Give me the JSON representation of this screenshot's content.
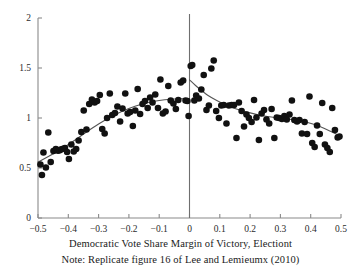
{
  "figure": {
    "xaxis_title": "Democratic Vote Share Margin of Victory, Electiont",
    "note": "Note: Replicate figure 16 of Lee and Lemieumx (2010)"
  },
  "chart_data": {
    "type": "scatter",
    "title": "",
    "subtitle": "",
    "xlabel": "Democratic Vote Share Margin of Victory, Electiont",
    "ylabel": "",
    "note": "Note: Replicate figure 16 of Lee and Lemieumx (2010)",
    "xlim": [
      -0.5,
      0.5
    ],
    "ylim": [
      0,
      2
    ],
    "xticks": [
      -0.5,
      -0.4,
      -0.3,
      -0.2,
      -0.1,
      0,
      0.1,
      0.2,
      0.3,
      0.4,
      0.5
    ],
    "xtick_labels": [
      "-0.5",
      "-0.4",
      "-0.3",
      "-0.2",
      "-0.1",
      "0",
      "0.1",
      "0.2",
      "0.3",
      "0.4",
      "0.5"
    ],
    "yticks": [
      0,
      0.5,
      1,
      1.5,
      2
    ],
    "ytick_labels": [
      "0",
      "0.5",
      "1",
      "1.5",
      "2"
    ],
    "grid": false,
    "legend": "none",
    "cutoff": 0,
    "cutoff_line": true,
    "marker_color": "#111111",
    "marker_size": 3.3,
    "fit_color": "#555555",
    "axis_color": "#8a8a8a",
    "series": [
      {
        "name": "binned means",
        "type": "scatter",
        "points": [
          [
            -0.492,
            0.535
          ],
          [
            -0.487,
            0.43
          ],
          [
            -0.482,
            0.655
          ],
          [
            -0.474,
            0.505
          ],
          [
            -0.466,
            0.855
          ],
          [
            -0.458,
            0.56
          ],
          [
            -0.449,
            0.67
          ],
          [
            -0.441,
            0.69
          ],
          [
            -0.434,
            0.672
          ],
          [
            -0.428,
            0.678
          ],
          [
            -0.423,
            0.688
          ],
          [
            -0.417,
            0.693
          ],
          [
            -0.411,
            0.7
          ],
          [
            -0.404,
            0.66
          ],
          [
            -0.398,
            0.59
          ],
          [
            -0.39,
            0.735
          ],
          [
            -0.382,
            0.665
          ],
          [
            -0.374,
            0.69
          ],
          [
            -0.366,
            0.775
          ],
          [
            -0.357,
            0.86
          ],
          [
            -0.349,
            1.075
          ],
          [
            -0.34,
            0.885
          ],
          [
            -0.331,
            1.14
          ],
          [
            -0.322,
            1.185
          ],
          [
            -0.313,
            1.155
          ],
          [
            -0.305,
            1.17
          ],
          [
            -0.296,
            1.23
          ],
          [
            -0.288,
            0.89
          ],
          [
            -0.28,
            0.845
          ],
          [
            -0.272,
            1.0
          ],
          [
            -0.263,
            1.245
          ],
          [
            -0.255,
            1.03
          ],
          [
            -0.246,
            1.05
          ],
          [
            -0.238,
            1.115
          ],
          [
            -0.229,
            0.965
          ],
          [
            -0.221,
            1.095
          ],
          [
            -0.212,
            1.245
          ],
          [
            -0.204,
            1.045
          ],
          [
            -0.196,
            1.06
          ],
          [
            -0.187,
            0.92
          ],
          [
            -0.179,
            1.075
          ],
          [
            -0.171,
            1.29
          ],
          [
            -0.163,
            1.04
          ],
          [
            -0.155,
            1.14
          ],
          [
            -0.147,
            1.17
          ],
          [
            -0.138,
            1.1
          ],
          [
            -0.13,
            1.205
          ],
          [
            -0.122,
            1.155
          ],
          [
            -0.113,
            1.235
          ],
          [
            -0.104,
            1.1
          ],
          [
            -0.096,
            1.385
          ],
          [
            -0.088,
            1.045
          ],
          [
            -0.079,
            1.065
          ],
          [
            -0.07,
            1.32
          ],
          [
            -0.062,
            1.175
          ],
          [
            -0.053,
            1.145
          ],
          [
            -0.045,
            1.09
          ],
          [
            -0.037,
            1.18
          ],
          [
            -0.029,
            1.355
          ],
          [
            -0.021,
            1.375
          ],
          [
            -0.013,
            1.175
          ],
          [
            -0.007,
            1.17
          ],
          [
            -0.003,
            1.02
          ],
          [
            0.004,
            1.52
          ],
          [
            0.009,
            1.53
          ],
          [
            0.016,
            1.175
          ],
          [
            0.022,
            1.225
          ],
          [
            0.031,
            1.195
          ],
          [
            0.039,
            1.285
          ],
          [
            0.047,
            1.43
          ],
          [
            0.056,
            1.08
          ],
          [
            0.064,
            1.125
          ],
          [
            0.072,
            1.495
          ],
          [
            0.08,
            1.575
          ],
          [
            0.088,
            1.07
          ],
          [
            0.097,
            1.0
          ],
          [
            0.105,
            1.125
          ],
          [
            0.113,
            1.13
          ],
          [
            0.122,
            0.945
          ],
          [
            0.13,
            1.125
          ],
          [
            0.139,
            1.13
          ],
          [
            0.147,
            1.13
          ],
          [
            0.155,
            0.8
          ],
          [
            0.163,
            1.155
          ],
          [
            0.172,
            1.07
          ],
          [
            0.18,
            0.915
          ],
          [
            0.188,
            1.035
          ],
          [
            0.196,
            1.0
          ],
          [
            0.205,
            0.96
          ],
          [
            0.213,
            1.18
          ],
          [
            0.221,
            1.005
          ],
          [
            0.229,
            0.78
          ],
          [
            0.238,
            1.045
          ],
          [
            0.246,
            1.08
          ],
          [
            0.254,
            0.985
          ],
          [
            0.263,
            0.945
          ],
          [
            0.271,
            1.09
          ],
          [
            0.28,
            0.8
          ],
          [
            0.288,
            1.005
          ],
          [
            0.296,
            1.0
          ],
          [
            0.305,
            0.99
          ],
          [
            0.313,
            1.02
          ],
          [
            0.321,
            0.985
          ],
          [
            0.33,
            1.035
          ],
          [
            0.338,
            1.175
          ],
          [
            0.346,
            0.98
          ],
          [
            0.355,
            0.965
          ],
          [
            0.363,
            0.98
          ],
          [
            0.371,
            0.845
          ],
          [
            0.38,
            0.96
          ],
          [
            0.388,
            0.84
          ],
          [
            0.396,
            1.215
          ],
          [
            0.405,
            0.75
          ],
          [
            0.413,
            0.71
          ],
          [
            0.421,
            0.925
          ],
          [
            0.43,
            0.84
          ],
          [
            0.438,
            1.15
          ],
          [
            0.447,
            0.735
          ],
          [
            0.455,
            0.7
          ],
          [
            0.463,
            0.66
          ],
          [
            0.471,
            1.1
          ],
          [
            0.48,
            0.88
          ],
          [
            0.489,
            0.805
          ],
          [
            0.495,
            0.815
          ]
        ]
      },
      {
        "name": "fit-left",
        "type": "line",
        "points": [
          [
            -0.5,
            0.56
          ],
          [
            -0.46,
            0.625
          ],
          [
            -0.42,
            0.695
          ],
          [
            -0.38,
            0.775
          ],
          [
            -0.34,
            0.86
          ],
          [
            -0.3,
            0.94
          ],
          [
            -0.26,
            1.01
          ],
          [
            -0.22,
            1.07
          ],
          [
            -0.18,
            1.118
          ],
          [
            -0.14,
            1.152
          ],
          [
            -0.1,
            1.175
          ],
          [
            -0.06,
            1.188
          ],
          [
            -0.03,
            1.192
          ],
          [
            0.0,
            1.192
          ]
        ]
      },
      {
        "name": "fit-right",
        "type": "line",
        "points": [
          [
            0.0,
            1.382
          ],
          [
            0.02,
            1.325
          ],
          [
            0.04,
            1.275
          ],
          [
            0.06,
            1.228
          ],
          [
            0.09,
            1.175
          ],
          [
            0.12,
            1.13
          ],
          [
            0.15,
            1.095
          ],
          [
            0.19,
            1.06
          ],
          [
            0.23,
            1.03
          ],
          [
            0.27,
            1.01
          ],
          [
            0.31,
            0.995
          ],
          [
            0.35,
            0.98
          ],
          [
            0.39,
            0.955
          ],
          [
            0.43,
            0.915
          ],
          [
            0.47,
            0.86
          ],
          [
            0.5,
            0.815
          ]
        ]
      }
    ]
  }
}
